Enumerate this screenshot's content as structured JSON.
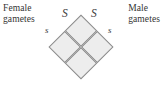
{
  "diagram": {
    "type": "punnett-square",
    "orientation": "rotated-45-degrees",
    "labels": {
      "female": {
        "line1": "Female",
        "line2": "gametes"
      },
      "male": {
        "line1": "Male",
        "line2": "gametes"
      }
    },
    "alleles": {
      "top_left": "S",
      "top_right": "S",
      "left": "s",
      "right": "s"
    },
    "grid": {
      "rows": 2,
      "columns": 2,
      "cells": [
        "",
        "",
        "",
        ""
      ]
    },
    "colors": {
      "cell_fill": "#ededed",
      "cell_border": "#8a8a8a",
      "text": "#343434",
      "background": "#ffffff"
    }
  }
}
